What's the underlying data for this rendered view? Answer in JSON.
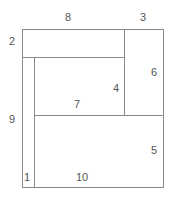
{
  "diagram": {
    "type": "rectangle-partition",
    "stroke_color": "#888888",
    "label_color": "#555555",
    "labels": [
      {
        "id": "8",
        "text": "8",
        "x": 68,
        "y": 17
      },
      {
        "id": "3",
        "text": "3",
        "x": 143,
        "y": 17
      },
      {
        "id": "2",
        "text": "2",
        "x": 12,
        "y": 41
      },
      {
        "id": "6",
        "text": "6",
        "x": 154,
        "y": 72
      },
      {
        "id": "4",
        "text": "4",
        "x": 116,
        "y": 88
      },
      {
        "id": "7",
        "text": "7",
        "x": 77,
        "y": 104
      },
      {
        "id": "9",
        "text": "9",
        "x": 12,
        "y": 119
      },
      {
        "id": "5",
        "text": "5",
        "x": 154,
        "y": 150
      },
      {
        "id": "1",
        "text": "1",
        "x": 27,
        "y": 177
      },
      {
        "id": "10",
        "text": "10",
        "x": 82,
        "y": 177
      }
    ]
  }
}
